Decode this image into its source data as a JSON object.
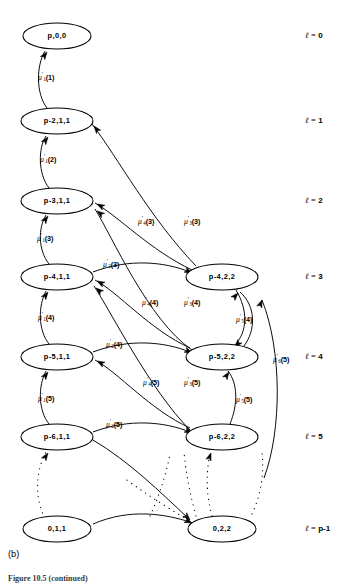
{
  "figure": {
    "panel_caption": "(b)",
    "figure_caption_truncated": "Figure 10.5 (continued)"
  },
  "levels": [
    {
      "id": "l0",
      "label_prefix": "ℓ",
      "eq": "=",
      "value": "0",
      "y": 36
    },
    {
      "id": "l1",
      "label_prefix": "ℓ",
      "eq": "=",
      "value": "1",
      "y": 121
    },
    {
      "id": "l2",
      "label_prefix": "ℓ",
      "eq": "=",
      "value": "2",
      "y": 201
    },
    {
      "id": "l3",
      "label_prefix": "ℓ",
      "eq": "=",
      "value": "3",
      "y": 277
    },
    {
      "id": "l4",
      "label_prefix": "ℓ",
      "eq": "=",
      "value": "4",
      "y": 357
    },
    {
      "id": "l5",
      "label_prefix": "ℓ",
      "eq": "=",
      "value": "5",
      "y": 437
    },
    {
      "id": "lp",
      "label_prefix": "ℓ",
      "eq": "=",
      "value": "p-1",
      "y": 529
    }
  ],
  "nodes": {
    "left": [
      {
        "id": "n-p00",
        "label": "p,0,0",
        "cx": 57,
        "cy": 36,
        "rx": 34,
        "ry": 13
      },
      {
        "id": "n-p2-11",
        "label": "p-2,1,1",
        "cx": 57,
        "cy": 121,
        "rx": 36,
        "ry": 13
      },
      {
        "id": "n-p3-11",
        "label": "p-3,1,1",
        "cx": 57,
        "cy": 201,
        "rx": 36,
        "ry": 13
      },
      {
        "id": "n-p4-11",
        "label": "p-4,1,1",
        "cx": 57,
        "cy": 277,
        "rx": 36,
        "ry": 13
      },
      {
        "id": "n-p5-11",
        "label": "p-5,1,1",
        "cx": 57,
        "cy": 357,
        "rx": 36,
        "ry": 13
      },
      {
        "id": "n-p6-11",
        "label": "p-6,1,1",
        "cx": 57,
        "cy": 437,
        "rx": 36,
        "ry": 13
      },
      {
        "id": "n-011",
        "label": "0,1,1",
        "cx": 57,
        "cy": 529,
        "rx": 34,
        "ry": 13
      }
    ],
    "right": [
      {
        "id": "n-p4-22",
        "label": "p-4,2,2",
        "cx": 222,
        "cy": 277,
        "rx": 36,
        "ry": 13
      },
      {
        "id": "n-p5-22",
        "label": "p-5,2,2",
        "cx": 222,
        "cy": 357,
        "rx": 36,
        "ry": 13
      },
      {
        "id": "n-p6-22",
        "label": "p-6,2,2",
        "cx": 222,
        "cy": 437,
        "rx": 36,
        "ry": 13
      },
      {
        "id": "n-022",
        "label": "0,2,2",
        "cx": 222,
        "cy": 529,
        "rx": 34,
        "ry": 13
      }
    ]
  },
  "edge_labels": [
    {
      "id": "e-mu1-1",
      "mu": "μ",
      "sub": "1",
      "arg": "(1)",
      "x": 38,
      "y": 78
    },
    {
      "id": "e-mu1-2",
      "mu": "μ",
      "sub": "1",
      "arg": "(2)",
      "x": 40,
      "y": 160
    },
    {
      "id": "e-mu1-3",
      "mu": "μ",
      "sub": "1",
      "arg": "(3)",
      "x": 37,
      "y": 239
    },
    {
      "id": "e-mu1-4",
      "mu": "μ",
      "sub": "1",
      "arg": "(4)",
      "x": 38,
      "y": 318
    },
    {
      "id": "e-mu1-5",
      "mu": "μ",
      "sub": "1",
      "arg": "(5)",
      "x": 38,
      "y": 399
    },
    {
      "id": "e-mu2-3",
      "mu": "μ",
      "sub": "2",
      "arg": "(3)",
      "x": 103,
      "y": 265
    },
    {
      "id": "e-mu2-4",
      "mu": "μ",
      "sub": "2",
      "arg": "(4)",
      "x": 106,
      "y": 345
    },
    {
      "id": "e-mu2-5",
      "mu": "μ",
      "sub": "2",
      "arg": "(5)",
      "x": 106,
      "y": 425
    },
    {
      "id": "e-mu3-3",
      "mu": "μ",
      "sub": "3",
      "arg": "(3)",
      "x": 184,
      "y": 222
    },
    {
      "id": "e-mu3-4",
      "mu": "μ",
      "sub": "3",
      "arg": "(4)",
      "x": 184,
      "y": 303
    },
    {
      "id": "e-mu3-5",
      "mu": "μ",
      "sub": "3",
      "arg": "(5)",
      "x": 184,
      "y": 383
    },
    {
      "id": "e-mu4-3",
      "mu": "μ",
      "sub": "4",
      "arg": "(3)",
      "x": 138,
      "y": 222
    },
    {
      "id": "e-mu4-4",
      "mu": "μ",
      "sub": "4",
      "arg": "(4)",
      "x": 142,
      "y": 303
    },
    {
      "id": "e-mu4-5",
      "mu": "μ",
      "sub": "4",
      "arg": "(5)",
      "x": 143,
      "y": 383
    },
    {
      "id": "e-mu5-4",
      "mu": "μ",
      "sub": "5",
      "arg": "(4)",
      "x": 236,
      "y": 320
    },
    {
      "id": "e-mu5-5",
      "mu": "μ",
      "sub": "5",
      "arg": "(5)",
      "x": 236,
      "y": 400
    },
    {
      "id": "e-mu6-5",
      "mu": "μ",
      "sub": "6",
      "arg": "(5)",
      "x": 273,
      "y": 360
    }
  ],
  "edges": [
    {
      "id": "edge-p2-to-p0",
      "d": "M 47 108 C 36 94 36 66 45 51",
      "arrow": {
        "x": 47,
        "y": 52,
        "angle": -54
      }
    },
    {
      "id": "edge-p3-to-p2",
      "d": "M 49 188 C 38 174 38 148 46 136",
      "arrow": {
        "x": 48,
        "y": 137,
        "angle": -54
      }
    },
    {
      "id": "edge-p4-to-p3",
      "d": "M 49 264 C 38 250 38 228 46 215",
      "arrow": {
        "x": 48,
        "y": 216,
        "angle": -54
      }
    },
    {
      "id": "edge-p5-to-p4",
      "d": "M 49 344 C 38 330 38 306 46 291",
      "arrow": {
        "x": 48,
        "y": 292,
        "angle": -54
      }
    },
    {
      "id": "edge-p6-to-p5",
      "d": "M 49 424 C 38 410 38 386 46 371",
      "arrow": {
        "x": 48,
        "y": 372,
        "angle": -54
      }
    },
    {
      "id": "edge-p422-to-p211",
      "d": "M 196 266 C 150 218 118 158 92 124",
      "arrow": {
        "x": 94,
        "y": 126,
        "angle": -128
      }
    },
    {
      "id": "edge-p422-to-p311",
      "d": "M 192 270 C 150 250 118 216 95 203",
      "arrow": {
        "x": 97,
        "y": 204,
        "angle": -152
      }
    },
    {
      "id": "edge-p522-to-p311",
      "d": "M 192 350 C 148 320 112 236 95 209",
      "arrow": {
        "x": 97,
        "y": 211,
        "angle": -143
      }
    },
    {
      "id": "edge-p411-to-p422",
      "d": "M 93 272 C 130 258 165 262 190 272",
      "arrow": {
        "x": 192,
        "y": 273,
        "angle": 26
      }
    },
    {
      "id": "edge-p522-to-p411",
      "d": "M 190 348 C 150 330 118 292 95 280",
      "arrow": {
        "x": 97,
        "y": 281,
        "angle": -152
      }
    },
    {
      "id": "edge-p622-to-p411",
      "d": "M 190 430 C 150 390 110 310 94 286",
      "arrow": {
        "x": 96,
        "y": 288,
        "angle": -140
      }
    },
    {
      "id": "edge-p511-to-p522",
      "d": "M 93 352 C 130 338 165 342 190 352",
      "arrow": {
        "x": 192,
        "y": 353,
        "angle": 26
      }
    },
    {
      "id": "edge-p622-to-p511",
      "d": "M 190 428 C 150 410 118 372 95 360",
      "arrow": {
        "x": 97,
        "y": 361,
        "angle": -152
      }
    },
    {
      "id": "edge-p611-to-p622",
      "d": "M 93 432 C 130 418 165 422 190 432",
      "arrow": {
        "x": 192,
        "y": 433,
        "angle": 26
      }
    },
    {
      "id": "edge-p422-to-p522",
      "d": "M 236 290 C 248 310 248 332 234 346",
      "arrow": {
        "x": 235,
        "y": 347,
        "angle": 131
      }
    },
    {
      "id": "edge-p522-to-p422",
      "d": "M 244 346 C 256 330 256 306 240 292",
      "arrow": {
        "x": 238,
        "y": 293,
        "angle": -48
      }
    },
    {
      "id": "edge-p622-to-p522",
      "d": "M 230 424 C 238 404 238 384 228 371",
      "arrow": {
        "x": 229,
        "y": 372,
        "angle": -56
      }
    },
    {
      "id": "edge-mu6-long",
      "d": "M 262 300 C 282 350 282 430 264 478",
      "arrow": {
        "x": 262,
        "y": 300,
        "angle": -69
      }
    },
    {
      "id": "edge-011-to-022",
      "d": "M 93 524 C 130 508 165 514 190 522",
      "arrow": {
        "x": 192,
        "y": 523,
        "angle": 24
      }
    },
    {
      "id": "edge-p611-to-022",
      "d": "M 93 440 C 130 462 160 492 188 518",
      "arrow": {
        "x": 190,
        "y": 520,
        "angle": 46
      }
    }
  ],
  "dotted_edges": [
    {
      "id": "dots-left-col",
      "d": "M 45 518 C 34 498 36 470 46 452",
      "arrow": {
        "x": 48,
        "y": 453,
        "angle": -56
      }
    },
    {
      "id": "dots-mid-1",
      "d": "M 150 516 C 160 494 166 474 170 454"
    },
    {
      "id": "dots-mid-2",
      "d": "M 196 516 C 190 494 186 474 184 452"
    },
    {
      "id": "dots-to-p622",
      "d": "M 212 516 C 206 494 206 474 210 452",
      "arrow": {
        "x": 211,
        "y": 453,
        "angle": -70
      }
    },
    {
      "id": "dots-right-col",
      "d": "M 252 514 C 262 492 264 472 262 452"
    },
    {
      "id": "dots-diag",
      "d": "M 188 520 C 168 508 146 494 124 478"
    }
  ]
}
